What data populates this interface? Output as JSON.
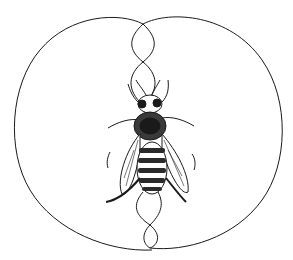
{
  "illustration": {
    "subject": "honeybee waggle dance",
    "style": "black ink line drawing on white",
    "colors": {
      "background": "#ffffff",
      "ink": "#1a1a1a",
      "stripe": "#2a2a2a"
    },
    "elements": [
      "left-loop-path",
      "right-loop-path",
      "figure-eight-waggle-run",
      "bee"
    ]
  }
}
